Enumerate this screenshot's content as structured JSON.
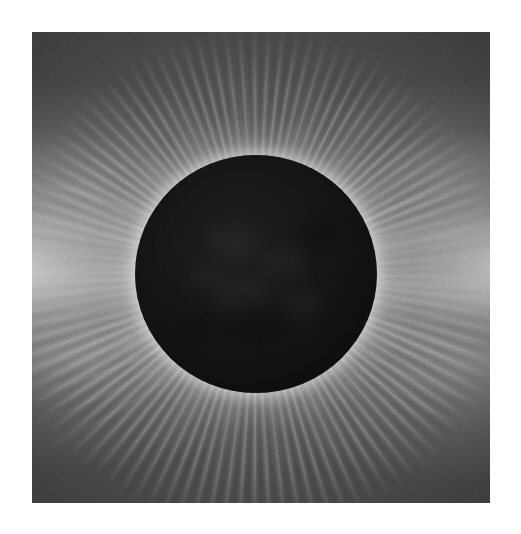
{
  "page": {
    "background_color": "#ffffff",
    "width": 521,
    "height": 534
  },
  "photo": {
    "subject": "total-solar-eclipse-corona",
    "alt_text": "Total solar eclipse: the black lunar disk surrounded by the white solar corona",
    "frame": {
      "x": 32,
      "y": 32,
      "width": 458,
      "height": 471
    },
    "rendering": "grayscale photograph",
    "caption": ""
  },
  "scene": {
    "sky": {
      "name": "eclipse-sky-background",
      "center_color": "#5e5e5e",
      "corner_color": "#2a2a2a"
    },
    "occulter": {
      "name": "lunar-disk",
      "center_x_pct": 48.9,
      "center_y_pct": 51.4,
      "radius_px": 121,
      "color": "#121212",
      "limb_glow_color": "#ffffff"
    },
    "corona": {
      "name": "solar-corona",
      "inner_ring_color": "#ffffff",
      "mid_color": "#c8c8c8",
      "outer_color": "#8a8a8a",
      "features": [
        {
          "name": "west-equatorial-streamer",
          "direction": "west",
          "extent": "to frame edge"
        },
        {
          "name": "east-equatorial-streamer",
          "direction": "east",
          "extent": "to frame edge"
        },
        {
          "name": "north-polar-plumes",
          "direction": "north",
          "extent": "fine radial rays"
        },
        {
          "name": "south-polar-plumes",
          "direction": "south",
          "extent": "fine radial rays"
        },
        {
          "name": "northwest-streamer-lobe",
          "direction": "northwest",
          "extent": "mid"
        },
        {
          "name": "southwest-streamer-lobe",
          "direction": "southwest",
          "extent": "mid"
        },
        {
          "name": "northeast-streamer-lobe",
          "direction": "northeast",
          "extent": "mid"
        },
        {
          "name": "southeast-streamer-lobe",
          "direction": "southeast",
          "extent": "mid"
        }
      ]
    }
  },
  "colors": {
    "paper": "#ffffff",
    "shadow": "#121212",
    "highlight": "#ffffff",
    "sky_mid": "#4d4d4d",
    "sky_dark": "#2a2a2a"
  }
}
